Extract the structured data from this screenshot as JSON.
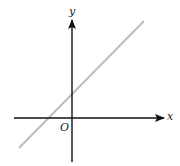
{
  "diagram": {
    "type": "coordinate-plane-line",
    "labels": {
      "x_axis": "x",
      "y_axis": "y",
      "origin": "O"
    },
    "colors": {
      "axes": "#111111",
      "line": "#bdbdbd",
      "text": "#222222"
    },
    "axes": {
      "x_axis": {
        "x1": 14,
        "y1": 118,
        "x2": 164,
        "y2": 118
      },
      "y_axis": {
        "x1": 72,
        "y1": 162,
        "x2": 72,
        "y2": 20
      }
    },
    "line": {
      "x1": 19,
      "y1": 148,
      "x2": 144,
      "y2": 21
    },
    "line_description": "Straight line with positive slope, positive y-intercept and negative x-intercept"
  }
}
